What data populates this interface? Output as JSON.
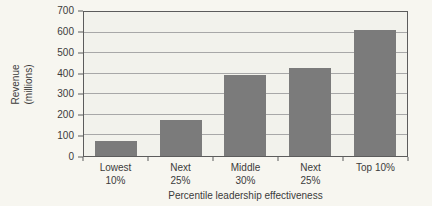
{
  "figure": {
    "bg_color": "#f7f6f0",
    "text_color": "#3b3b3b"
  },
  "chart_data": {
    "type": "bar",
    "title": "",
    "categories": [
      "Lowest\n10%",
      "Next\n25%",
      "Middle\n30%",
      "Next\n25%",
      "Top 10%"
    ],
    "values": [
      75,
      175,
      395,
      430,
      615
    ],
    "ylabel": "Revenue\n(millions)",
    "xlabel": "Percentile leadership effectiveness",
    "ylim": [
      0,
      700
    ],
    "yticks": [
      0,
      100,
      200,
      300,
      400,
      500,
      600,
      700
    ],
    "grid": true,
    "legend": "none",
    "bar_color": "#7b7b7b",
    "plot_bg_color": "#f2f2ec",
    "grid_color": "#a8a8a8",
    "axis_color": "#5c5c5c"
  }
}
